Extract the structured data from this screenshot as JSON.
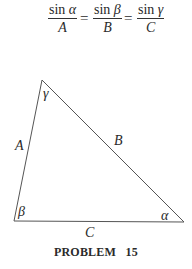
{
  "formula": {
    "fractions": [
      {
        "numerator_fn": "sin",
        "numerator_var": "α",
        "denominator": "A"
      },
      {
        "numerator_fn": "sin",
        "numerator_var": "β",
        "denominator": "B"
      },
      {
        "numerator_fn": "sin",
        "numerator_var": "γ",
        "denominator": "C"
      }
    ],
    "equals": "="
  },
  "triangle": {
    "vertices": {
      "top": [
        42,
        80
      ],
      "bottom_left": [
        14,
        221
      ],
      "bottom_right": [
        184,
        222
      ]
    },
    "side_labels": {
      "left": "A",
      "hypotenuse": "B",
      "bottom": "C"
    },
    "angle_labels": {
      "top": "γ",
      "bottom_left": "β",
      "bottom_right": "α"
    },
    "stroke_color": "#555555"
  },
  "caption": "PROBLEM   15"
}
